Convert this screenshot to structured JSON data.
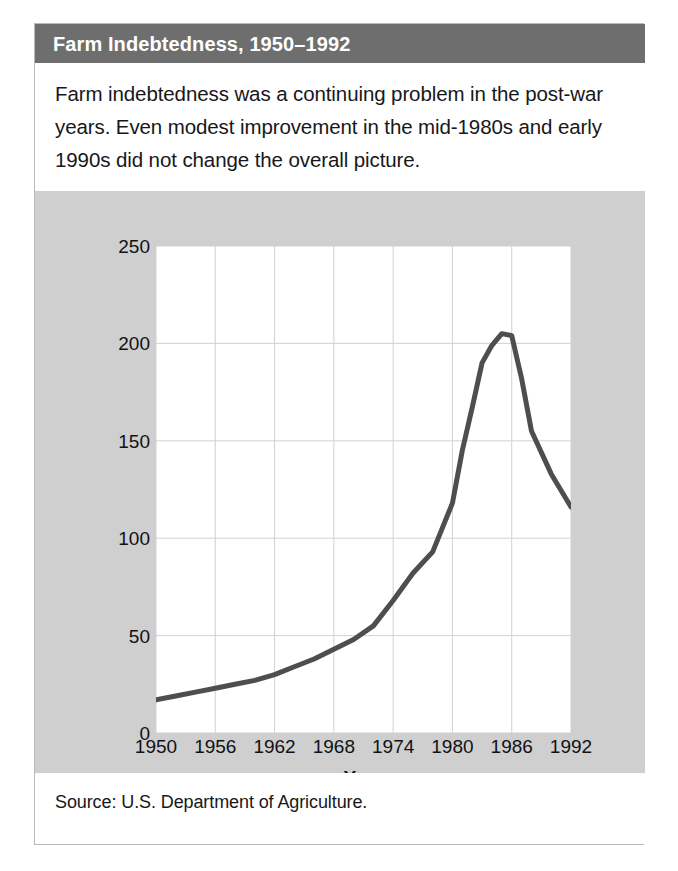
{
  "figure": {
    "title": "Farm Indebtedness, 1950–1992",
    "caption": "Farm indebtedness was a continuing problem in the post-war years. Even modest improvement in the mid-1980s and early 1990s did not change the overall picture.",
    "source": "Source: U.S. Department of Agriculture."
  },
  "colors": {
    "title_bar": "#6e6e6e",
    "title_text": "#ffffff",
    "panel_background": "#cfcfcf",
    "plot_background": "#ffffff",
    "grid": "#d2d2d2",
    "line": "#4e4e4e",
    "frame": "#b9b9b9",
    "text": "#17181a"
  },
  "chart_data": {
    "type": "line",
    "title": "Farm Indebtedness, 1950–1992",
    "xlabel": "Year",
    "ylabel": "Billions of dollars",
    "xlim": [
      1950,
      1992
    ],
    "ylim": [
      0,
      250
    ],
    "xticks": [
      "1950",
      "1956",
      "1962",
      "1968",
      "1974",
      "1980",
      "1986",
      "1992"
    ],
    "yticks": [
      "0",
      "50",
      "100",
      "150",
      "200",
      "250"
    ],
    "grid": "horizontal-and-vertical",
    "legend": "none",
    "series": [
      {
        "name": "Farm indebtedness",
        "x": [
          1950,
          1952,
          1954,
          1956,
          1958,
          1960,
          1962,
          1964,
          1966,
          1968,
          1970,
          1972,
          1974,
          1976,
          1978,
          1980,
          1981,
          1982,
          1983,
          1984,
          1985,
          1986,
          1987,
          1988,
          1990,
          1992
        ],
        "values": [
          17,
          19,
          21,
          23,
          25,
          27,
          30,
          34,
          38,
          43,
          48,
          55,
          68,
          82,
          93,
          118,
          145,
          167,
          190,
          199,
          205,
          204,
          182,
          155,
          133,
          116
        ]
      }
    ]
  }
}
